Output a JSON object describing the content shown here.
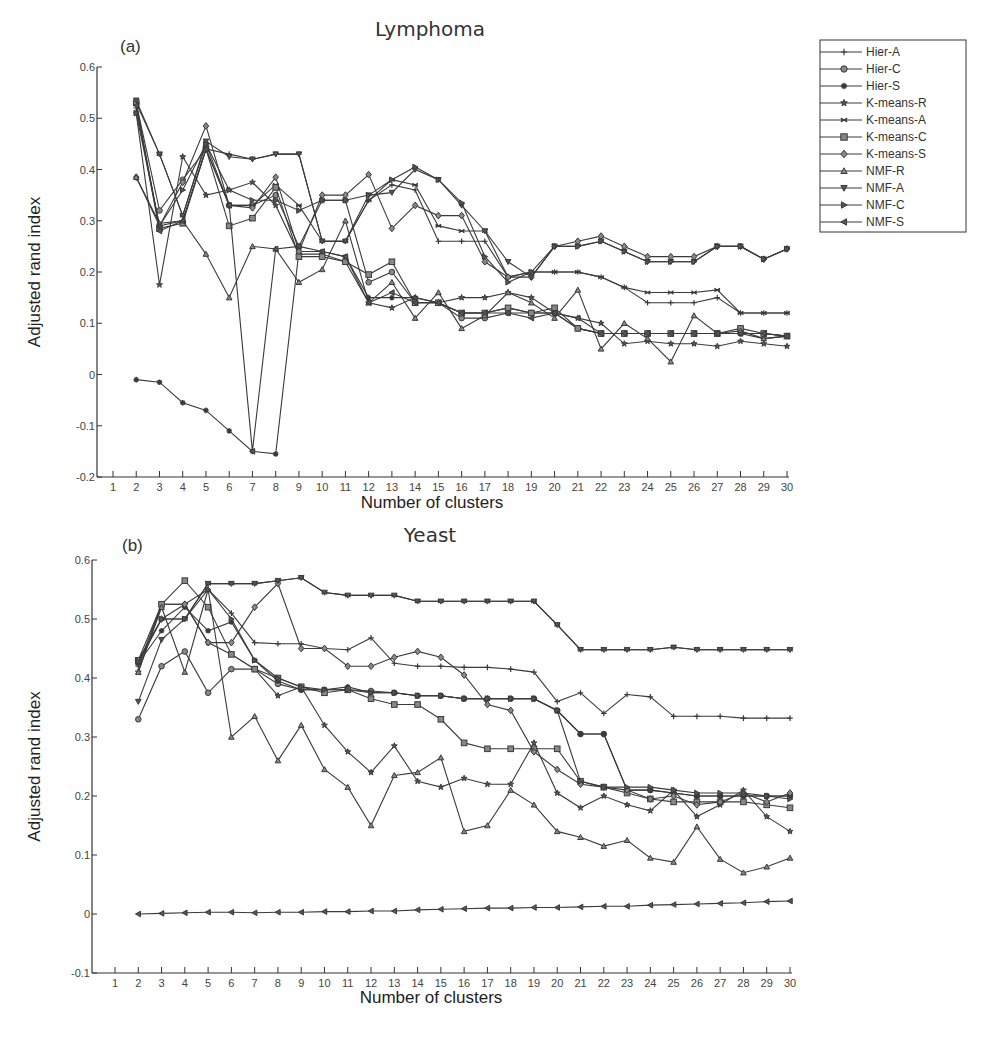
{
  "legend": {
    "entries": [
      "Hier-A",
      "Hier-C",
      "Hier-S",
      "K-means-R",
      "K-means-A",
      "K-means-C",
      "K-means-S",
      "NMF-R",
      "NMF-A",
      "NMF-C",
      "NMF-S"
    ],
    "markers": [
      "plus",
      "circle",
      "asterisk",
      "star",
      "x",
      "square",
      "diamond",
      "triangle-up",
      "triangle-down",
      "triangle-right",
      "triangle-left"
    ]
  },
  "chart_data": [
    {
      "type": "line",
      "panel": "(a)",
      "title": "Lymphoma",
      "xlabel": "Number of clusters",
      "ylabel": "Adjusted rand index",
      "xlim": [
        1,
        30
      ],
      "ylim": [
        -0.2,
        0.6
      ],
      "xticks": [
        1,
        2,
        3,
        4,
        5,
        6,
        7,
        8,
        9,
        10,
        11,
        12,
        13,
        14,
        15,
        16,
        17,
        18,
        19,
        20,
        21,
        22,
        23,
        24,
        25,
        26,
        27,
        28,
        29,
        30
      ],
      "yticks": [
        -0.2,
        -0.1,
        0,
        0.1,
        0.2,
        0.3,
        0.4,
        0.5,
        0.6
      ],
      "ytick_labels": [
        "-0.2",
        "-0.1",
        "0",
        "0.1",
        "0.2",
        "0.3",
        "0.4",
        "0.5",
        "0.6"
      ],
      "grid": false,
      "legend_position": "right-outside",
      "x": [
        2,
        3,
        4,
        5,
        6,
        7,
        8,
        9,
        10,
        11,
        12,
        13,
        14,
        15,
        16,
        17,
        18,
        19,
        20,
        21,
        22,
        23,
        24,
        25,
        26,
        27,
        28,
        29,
        30
      ],
      "series": [
        {
          "name": "Hier-A",
          "marker": "plus",
          "values": [
            0.52,
            0.29,
            0.3,
            0.44,
            0.43,
            0.42,
            0.43,
            0.43,
            0.26,
            0.26,
            0.34,
            0.37,
            0.36,
            0.26,
            0.26,
            0.26,
            0.19,
            0.2,
            0.2,
            0.2,
            0.19,
            0.17,
            0.14,
            0.14,
            0.14,
            0.15,
            0.12,
            0.12,
            0.12
          ]
        },
        {
          "name": "Hier-C",
          "marker": "circle",
          "values": [
            0.53,
            0.32,
            0.38,
            0.44,
            0.33,
            0.33,
            0.35,
            0.25,
            0.34,
            0.34,
            0.18,
            0.2,
            0.14,
            0.14,
            0.11,
            0.11,
            0.12,
            0.12,
            0.12,
            0.09,
            0.08,
            0.08,
            0.08,
            0.08,
            0.08,
            0.08,
            0.08,
            0.08,
            0.075
          ]
        },
        {
          "name": "Hier-S",
          "marker": "asterisk",
          "values": [
            -0.01,
            -0.015,
            -0.055,
            -0.07,
            -0.11,
            -0.15,
            -0.155,
            0.24,
            0.24,
            0.23,
            0.15,
            0.15,
            0.15,
            0.14,
            0.12,
            0.12,
            0.13,
            0.12,
            0.12,
            0.09,
            0.08,
            0.08,
            0.08,
            0.08,
            0.08,
            0.08,
            0.08,
            0.07,
            0.075
          ]
        },
        {
          "name": "K-means-R",
          "marker": "star",
          "values": [
            0.51,
            0.175,
            0.425,
            0.35,
            0.36,
            0.375,
            0.33,
            0.235,
            0.235,
            0.22,
            0.14,
            0.13,
            0.15,
            0.14,
            0.15,
            0.15,
            0.16,
            0.15,
            0.12,
            0.11,
            0.1,
            0.06,
            0.065,
            0.06,
            0.06,
            0.055,
            0.065,
            0.06,
            0.055
          ]
        },
        {
          "name": "K-means-A",
          "marker": "x",
          "values": [
            0.53,
            0.43,
            0.31,
            0.45,
            0.33,
            0.33,
            0.37,
            0.33,
            0.26,
            0.26,
            0.34,
            0.38,
            0.37,
            0.29,
            0.28,
            0.28,
            0.19,
            0.2,
            0.2,
            0.2,
            0.19,
            0.17,
            0.16,
            0.16,
            0.16,
            0.165,
            0.12,
            0.12,
            0.12
          ]
        },
        {
          "name": "K-means-C",
          "marker": "square",
          "values": [
            0.53,
            0.285,
            0.295,
            0.44,
            0.29,
            0.305,
            0.365,
            0.23,
            0.23,
            0.22,
            0.195,
            0.22,
            0.14,
            0.14,
            0.12,
            0.12,
            0.13,
            0.12,
            0.13,
            0.09,
            0.08,
            0.08,
            0.08,
            0.08,
            0.08,
            0.08,
            0.09,
            0.08,
            0.075
          ]
        },
        {
          "name": "K-means-S",
          "marker": "diamond",
          "values": [
            0.385,
            0.29,
            0.375,
            0.485,
            0.33,
            0.325,
            0.385,
            0.24,
            0.35,
            0.35,
            0.39,
            0.285,
            0.33,
            0.31,
            0.31,
            0.22,
            0.19,
            0.19,
            0.25,
            0.26,
            0.27,
            0.25,
            0.23,
            0.23,
            0.23,
            0.25,
            0.25,
            0.225,
            0.245
          ]
        },
        {
          "name": "NMF-R",
          "marker": "triangle-up",
          "values": [
            0.385,
            0.295,
            0.3,
            0.235,
            0.15,
            0.25,
            0.245,
            0.18,
            0.205,
            0.3,
            0.14,
            0.18,
            0.11,
            0.16,
            0.09,
            0.115,
            0.16,
            0.14,
            0.11,
            0.165,
            0.05,
            0.1,
            0.07,
            0.025,
            0.115,
            0.08,
            0.085,
            0.07,
            0.075
          ]
        },
        {
          "name": "NMF-A",
          "marker": "triangle-down",
          "values": [
            0.535,
            0.43,
            0.31,
            0.455,
            0.425,
            0.42,
            0.43,
            0.43,
            0.26,
            0.26,
            0.35,
            0.355,
            0.4,
            0.38,
            0.33,
            0.28,
            0.22,
            0.19,
            0.25,
            0.25,
            0.26,
            0.24,
            0.22,
            0.22,
            0.22,
            0.25,
            0.25,
            0.225,
            0.245
          ]
        },
        {
          "name": "NMF-C",
          "marker": "triangle-right",
          "values": [
            0.51,
            0.29,
            0.36,
            0.45,
            0.36,
            0.34,
            0.34,
            0.32,
            0.34,
            0.34,
            0.35,
            0.38,
            0.405,
            0.38,
            0.335,
            0.23,
            0.18,
            0.2,
            0.25,
            0.25,
            0.26,
            0.24,
            0.22,
            0.22,
            0.22,
            0.25,
            0.25,
            0.225,
            0.245
          ]
        },
        {
          "name": "NMF-S",
          "marker": "triangle-left",
          "values": [
            0.525,
            0.28,
            0.3,
            0.44,
            0.33,
            -0.15,
            0.245,
            0.25,
            0.24,
            0.23,
            0.14,
            0.16,
            0.14,
            0.14,
            0.12,
            0.12,
            0.12,
            0.11,
            0.12,
            0.11,
            0.08,
            0.08,
            0.08,
            0.08,
            0.08,
            0.08,
            0.08,
            0.08,
            0.075
          ]
        }
      ]
    },
    {
      "type": "line",
      "panel": "(b)",
      "title": "Yeast",
      "xlabel": "Number of clusters",
      "ylabel": "Adjusted rand index",
      "xlim": [
        1,
        30
      ],
      "ylim": [
        -0.1,
        0.6
      ],
      "xticks": [
        1,
        2,
        3,
        4,
        5,
        6,
        7,
        8,
        9,
        10,
        11,
        12,
        13,
        14,
        15,
        16,
        17,
        18,
        19,
        20,
        21,
        22,
        23,
        24,
        25,
        26,
        27,
        28,
        29,
        30
      ],
      "yticks": [
        -0.1,
        0,
        0.1,
        0.2,
        0.3,
        0.4,
        0.5,
        0.6
      ],
      "ytick_labels": [
        "-0.1",
        "0",
        "0.1",
        "0.2",
        "0.3",
        "0.4",
        "0.5",
        "0.6"
      ],
      "grid": false,
      "x": [
        2,
        3,
        4,
        5,
        6,
        7,
        8,
        9,
        10,
        11,
        12,
        13,
        14,
        15,
        16,
        17,
        18,
        19,
        20,
        21,
        22,
        23,
        24,
        25,
        26,
        27,
        28,
        29,
        30
      ],
      "series": [
        {
          "name": "Hier-A",
          "marker": "plus",
          "values": [
            0.42,
            0.525,
            0.525,
            0.55,
            0.51,
            0.46,
            0.458,
            0.458,
            0.45,
            0.448,
            0.468,
            0.425,
            0.42,
            0.42,
            0.418,
            0.418,
            0.415,
            0.41,
            0.36,
            0.375,
            0.34,
            0.372,
            0.368,
            0.335,
            0.335,
            0.335,
            0.332,
            0.332,
            0.332
          ]
        },
        {
          "name": "Hier-C",
          "marker": "circle",
          "values": [
            0.33,
            0.42,
            0.445,
            0.375,
            0.415,
            0.415,
            0.39,
            0.38,
            0.38,
            0.38,
            0.378,
            0.375,
            0.37,
            0.37,
            0.365,
            0.365,
            0.365,
            0.365,
            0.345,
            0.305,
            0.305,
            0.21,
            0.21,
            0.205,
            0.2,
            0.2,
            0.2,
            0.2,
            0.2
          ]
        },
        {
          "name": "Hier-S",
          "marker": "asterisk",
          "values": [
            0.425,
            0.48,
            0.52,
            0.48,
            0.495,
            0.43,
            0.395,
            0.38,
            0.38,
            0.385,
            0.375,
            0.375,
            0.37,
            0.37,
            0.365,
            0.365,
            0.365,
            0.365,
            0.345,
            0.305,
            0.305,
            0.21,
            0.21,
            0.205,
            0.2,
            0.2,
            0.2,
            0.2,
            0.2
          ]
        },
        {
          "name": "K-means-R",
          "marker": "star",
          "values": [
            0.41,
            0.525,
            0.525,
            0.46,
            0.44,
            0.415,
            0.37,
            0.385,
            0.32,
            0.275,
            0.24,
            0.285,
            0.225,
            0.215,
            0.23,
            0.22,
            0.22,
            0.29,
            0.205,
            0.18,
            0.2,
            0.185,
            0.175,
            0.21,
            0.165,
            0.185,
            0.21,
            0.165,
            0.14
          ]
        },
        {
          "name": "K-means-A",
          "marker": "x",
          "values": [
            0.425,
            0.5,
            0.5,
            0.56,
            0.56,
            0.56,
            0.565,
            0.57,
            0.545,
            0.54,
            0.54,
            0.54,
            0.53,
            0.53,
            0.53,
            0.53,
            0.53,
            0.53,
            0.49,
            0.448,
            0.448,
            0.448,
            0.448,
            0.452,
            0.448,
            0.448,
            0.448,
            0.448,
            0.448
          ]
        },
        {
          "name": "K-means-C",
          "marker": "square",
          "values": [
            0.43,
            0.525,
            0.565,
            0.52,
            0.44,
            0.415,
            0.4,
            0.385,
            0.375,
            0.38,
            0.365,
            0.355,
            0.355,
            0.33,
            0.29,
            0.28,
            0.28,
            0.28,
            0.28,
            0.225,
            0.215,
            0.205,
            0.195,
            0.19,
            0.19,
            0.19,
            0.19,
            0.185,
            0.18
          ]
        },
        {
          "name": "K-means-S",
          "marker": "diamond",
          "values": [
            0.43,
            0.5,
            0.525,
            0.46,
            0.46,
            0.52,
            0.56,
            0.45,
            0.45,
            0.42,
            0.42,
            0.435,
            0.445,
            0.435,
            0.405,
            0.355,
            0.345,
            0.275,
            0.245,
            0.22,
            0.215,
            0.21,
            0.195,
            0.2,
            0.185,
            0.19,
            0.205,
            0.19,
            0.205
          ]
        },
        {
          "name": "NMF-R",
          "marker": "triangle-up",
          "values": [
            0.41,
            0.52,
            0.41,
            0.55,
            0.3,
            0.335,
            0.26,
            0.32,
            0.245,
            0.215,
            0.15,
            0.235,
            0.24,
            0.265,
            0.14,
            0.15,
            0.21,
            0.185,
            0.14,
            0.13,
            0.115,
            0.125,
            0.095,
            0.088,
            0.148,
            0.093,
            0.07,
            0.08,
            0.095
          ]
        },
        {
          "name": "NMF-A",
          "marker": "triangle-down",
          "values": [
            0.36,
            0.465,
            0.5,
            0.56,
            0.56,
            0.56,
            0.565,
            0.57,
            0.545,
            0.54,
            0.54,
            0.54,
            0.53,
            0.53,
            0.53,
            0.53,
            0.53,
            0.53,
            0.49,
            0.448,
            0.448,
            0.448,
            0.448,
            0.452,
            0.448,
            0.448,
            0.448,
            0.448,
            0.448
          ]
        },
        {
          "name": "NMF-C",
          "marker": "triangle-right",
          "values": [
            0.428,
            0.5,
            0.5,
            0.55,
            0.5,
            0.43,
            0.4,
            0.385,
            0.38,
            0.38,
            0.375,
            0.375,
            0.37,
            0.37,
            0.365,
            0.365,
            0.365,
            0.365,
            0.345,
            0.225,
            0.215,
            0.215,
            0.215,
            0.21,
            0.205,
            0.205,
            0.205,
            0.2,
            0.195
          ]
        },
        {
          "name": "NMF-S",
          "marker": "triangle-left",
          "values": [
            0.0,
            0.001,
            0.002,
            0.003,
            0.003,
            0.002,
            0.003,
            0.003,
            0.004,
            0.004,
            0.005,
            0.005,
            0.007,
            0.008,
            0.009,
            0.01,
            0.01,
            0.011,
            0.011,
            0.012,
            0.013,
            0.013,
            0.015,
            0.016,
            0.017,
            0.018,
            0.019,
            0.021,
            0.022
          ]
        }
      ]
    }
  ]
}
